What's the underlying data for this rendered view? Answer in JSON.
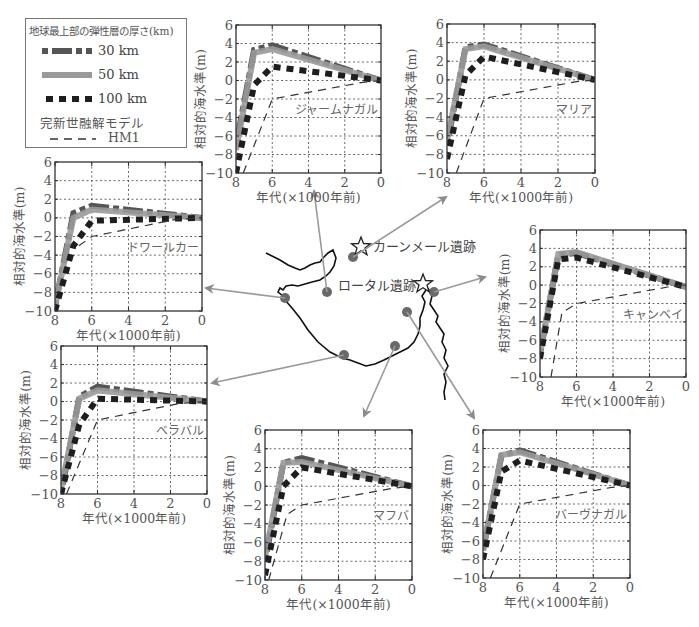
{
  "legend": {
    "title": "地球最上部の弾性層の厚さ(km)",
    "items": [
      {
        "label": "30 km",
        "style": "dashdot-dark",
        "color": "#555555"
      },
      {
        "label": "50 km",
        "style": "solid-gray",
        "color": "#9a9a9a"
      },
      {
        "label": "100 km",
        "style": "dotted-black",
        "color": "#1e1e1e"
      }
    ],
    "model_title": "完新世融解モデル",
    "model_item": {
      "label": "HM1",
      "style": "dashed-thin",
      "color": "#333333"
    }
  },
  "axes": {
    "xlabel": "年代(×1000年前)",
    "ylabel": "相対的海水準(m)",
    "xticks": [
      8,
      6,
      4,
      2,
      0
    ],
    "yticks": [
      6,
      4,
      2,
      0,
      -2,
      -4,
      -6,
      -8,
      -10
    ],
    "xlim": [
      8,
      0
    ],
    "ylim": [
      -10,
      6
    ]
  },
  "map": {
    "sites": [
      {
        "name": "カーンメール遺跡",
        "type": "star"
      },
      {
        "name": "ロータル遺跡",
        "type": "star"
      }
    ]
  },
  "chart_data": [
    {
      "type": "line",
      "title": "ジャームナガル",
      "xlabel": "年代(×1000年前)",
      "ylabel": "相対的海水準(m)",
      "xlim": [
        8,
        0
      ],
      "ylim": [
        -10,
        6
      ],
      "grid": true,
      "series": [
        {
          "name": "30 km",
          "x": [
            8,
            7,
            6,
            0
          ],
          "y": [
            -7,
            3.3,
            3.8,
            0
          ]
        },
        {
          "name": "50 km",
          "x": [
            8,
            7,
            6,
            0
          ],
          "y": [
            -7.5,
            3.0,
            3.4,
            0
          ]
        },
        {
          "name": "100 km",
          "x": [
            8,
            7,
            6,
            0
          ],
          "y": [
            -10,
            -0.5,
            1.5,
            0
          ]
        },
        {
          "name": "HM1",
          "x": [
            7.6,
            6,
            1,
            0
          ],
          "y": [
            -10,
            -2,
            -0.2,
            0
          ]
        }
      ]
    },
    {
      "type": "line",
      "title": "マリア",
      "xlabel": "年代(×1000年前)",
      "ylabel": "相対的海水準(m)",
      "xlim": [
        8,
        0
      ],
      "ylim": [
        -10,
        6
      ],
      "grid": true,
      "series": [
        {
          "name": "30 km",
          "x": [
            8,
            7,
            6,
            0
          ],
          "y": [
            -7,
            3.5,
            3.8,
            0
          ]
        },
        {
          "name": "50 km",
          "x": [
            8,
            7,
            6,
            0
          ],
          "y": [
            -6.5,
            3.3,
            3.6,
            0
          ]
        },
        {
          "name": "100 km",
          "x": [
            8,
            7,
            6,
            0
          ],
          "y": [
            -8.5,
            0.5,
            2.5,
            0
          ]
        },
        {
          "name": "HM1",
          "x": [
            7.5,
            6,
            1,
            0
          ],
          "y": [
            -10,
            -2,
            -0.2,
            0
          ]
        }
      ]
    },
    {
      "type": "line",
      "title": "ドワールカー",
      "xlabel": "年代(×1000年前)",
      "ylabel": "相対的海水準(m)",
      "xlim": [
        8,
        0
      ],
      "ylim": [
        -10,
        6
      ],
      "grid": true,
      "series": [
        {
          "name": "30 km",
          "x": [
            8,
            7,
            6,
            0
          ],
          "y": [
            -9.5,
            0.5,
            1.3,
            0
          ]
        },
        {
          "name": "50 km",
          "x": [
            8,
            7,
            6,
            0
          ],
          "y": [
            -9.5,
            0,
            0.9,
            0
          ]
        },
        {
          "name": "100 km",
          "x": [
            8,
            7,
            6,
            0
          ],
          "y": [
            -10,
            -3,
            -0.3,
            0
          ]
        },
        {
          "name": "HM1",
          "x": [
            6.7,
            6,
            1.5,
            0
          ],
          "y": [
            -3,
            -2,
            -0.2,
            0
          ]
        }
      ]
    },
    {
      "type": "line",
      "title": "キャンベイ",
      "xlabel": "年代(×1000年前)",
      "ylabel": "相対的海水準(m)",
      "xlim": [
        8,
        0
      ],
      "ylim": [
        -10,
        6
      ],
      "grid": true,
      "series": [
        {
          "name": "30 km",
          "x": [
            8,
            7,
            6,
            0
          ],
          "y": [
            -7.5,
            3.3,
            3.5,
            -0.2
          ]
        },
        {
          "name": "50 km",
          "x": [
            8,
            7,
            6,
            0
          ],
          "y": [
            -7.5,
            3.4,
            3.6,
            -0.2
          ]
        },
        {
          "name": "100 km",
          "x": [
            8,
            7,
            6,
            0
          ],
          "y": [
            -8,
            2.8,
            3.0,
            -0.2
          ]
        },
        {
          "name": "HM1",
          "x": [
            7.4,
            6.8,
            6,
            1,
            0
          ],
          "y": [
            -10,
            -3,
            -2,
            -0.2,
            0
          ]
        }
      ]
    },
    {
      "type": "line",
      "title": "ベラバル",
      "xlabel": "年代(×1000年前)",
      "ylabel": "相対的海水準(m)",
      "xlim": [
        8,
        0
      ],
      "ylim": [
        -10,
        6
      ],
      "grid": true,
      "series": [
        {
          "name": "30 km",
          "x": [
            8,
            7,
            6,
            0
          ],
          "y": [
            -10,
            0.5,
            1.6,
            0
          ]
        },
        {
          "name": "50 km",
          "x": [
            8,
            7,
            6,
            0
          ],
          "y": [
            -9.5,
            0.3,
            1.2,
            0
          ]
        },
        {
          "name": "100 km",
          "x": [
            8,
            7,
            6,
            0
          ],
          "y": [
            -10,
            -2.5,
            0.3,
            0
          ]
        },
        {
          "name": "HM1",
          "x": [
            7.7,
            6,
            1.5,
            0
          ],
          "y": [
            -10,
            -2,
            -0.2,
            0
          ]
        }
      ]
    },
    {
      "type": "line",
      "title": "マフバ",
      "xlabel": "年代(×1000年前)",
      "ylabel": "相対的海水準(m)",
      "xlim": [
        8,
        0
      ],
      "ylim": [
        -10,
        6
      ],
      "grid": true,
      "series": [
        {
          "name": "30 km",
          "x": [
            8,
            7,
            6,
            0
          ],
          "y": [
            -8,
            2.5,
            3.0,
            0
          ]
        },
        {
          "name": "50 km",
          "x": [
            8,
            7,
            6,
            0
          ],
          "y": [
            -7.5,
            2.5,
            2.6,
            0
          ]
        },
        {
          "name": "100 km",
          "x": [
            8,
            7,
            6,
            0
          ],
          "y": [
            -9.5,
            0,
            2.0,
            0
          ]
        },
        {
          "name": "HM1",
          "x": [
            7.8,
            6.8,
            6,
            1,
            0
          ],
          "y": [
            -10,
            -3,
            -2,
            -0.2,
            0
          ]
        }
      ]
    },
    {
      "type": "line",
      "title": "バーヴナガル",
      "xlabel": "年代(×1000年前)",
      "ylabel": "相対的海水準(m)",
      "xlim": [
        8,
        0
      ],
      "ylim": [
        -10,
        6
      ],
      "grid": true,
      "series": [
        {
          "name": "30 km",
          "x": [
            8,
            7,
            6,
            0
          ],
          "y": [
            -7,
            3.2,
            3.8,
            0
          ]
        },
        {
          "name": "50 km",
          "x": [
            8,
            7,
            6,
            0
          ],
          "y": [
            -7,
            3.3,
            3.6,
            0
          ]
        },
        {
          "name": "100 km",
          "x": [
            8,
            7,
            6,
            0
          ],
          "y": [
            -8,
            1.5,
            2.7,
            0
          ]
        },
        {
          "name": "HM1",
          "x": [
            7.6,
            6,
            1,
            0
          ],
          "y": [
            -10,
            -2,
            -0.2,
            0
          ]
        }
      ]
    }
  ]
}
